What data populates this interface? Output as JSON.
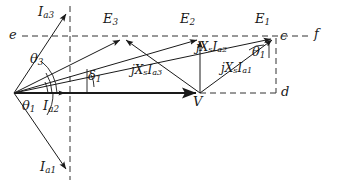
{
  "figure": {
    "type": "phasor-diagram",
    "width": 337,
    "height": 191,
    "background_color": "#ffffff",
    "line_color": "#1a1a1a",
    "dashed_color": "#333333"
  },
  "points": {
    "origin": {
      "label": "",
      "x": 14,
      "y": 93
    },
    "V": {
      "label": "V",
      "x": 200,
      "y": 93
    },
    "E1": {
      "label": "E",
      "sub": "1",
      "x": 275,
      "y": 37
    },
    "E2": {
      "label": "E",
      "sub": "2",
      "x": 200,
      "y": 37
    },
    "E3": {
      "label": "E",
      "sub": "3",
      "x": 123,
      "y": 37
    },
    "Ia1_tip": {
      "label": "I",
      "sub": "a1",
      "x": 69,
      "y": 172
    },
    "Ia2_tip": {
      "label": "I",
      "sub": "a2",
      "x": 68,
      "y": 93
    },
    "Ia3_tip": {
      "label": "I",
      "sub": "a3",
      "x": 68,
      "y": 11
    }
  },
  "axis_labels": {
    "e": "e",
    "f": "f",
    "c": "c",
    "d": "d"
  },
  "phasor_labels": {
    "E1": {
      "text": "E",
      "sub": "1"
    },
    "E2": {
      "text": "E",
      "sub": "2"
    },
    "E3": {
      "text": "E",
      "sub": "3"
    },
    "V": {
      "text": "V",
      "sub": ""
    },
    "Ia1": {
      "text": "I",
      "sub": "a1"
    },
    "Ia2": {
      "text": "I",
      "sub": "a2"
    },
    "Ia3": {
      "text": "I",
      "sub": "a3"
    }
  },
  "reactance_drops": [
    {
      "id": "jXsIa1",
      "prefix": "jX",
      "sub1": "s",
      "cur": "I",
      "sub2": "a1",
      "x": 224,
      "y": 70
    },
    {
      "id": "jXsIa2",
      "prefix": "jX",
      "sub1": "s",
      "cur": "I",
      "sub2": "a2",
      "x": 197,
      "y": 47
    },
    {
      "id": "jXsIa3",
      "prefix": "jX",
      "sub1": "s",
      "cur": "I",
      "sub2": "a3",
      "x": 133,
      "y": 71
    }
  ],
  "angles": [
    {
      "id": "theta1_origin",
      "glyph": "θ",
      "sub": "1",
      "x": 26,
      "y": 101
    },
    {
      "id": "theta3_origin",
      "glyph": "θ",
      "sub": "3",
      "x": 33,
      "y": 57
    },
    {
      "id": "delta1",
      "glyph": "δ",
      "sub": "1",
      "x": 87,
      "y": 71
    },
    {
      "id": "theta1_E1",
      "glyph": "θ",
      "sub": "1",
      "x": 254,
      "y": 49
    }
  ],
  "dashed_lines": {
    "ef_horizontal": {
      "name": "e-f reference line",
      "x1": 22,
      "y1": 36,
      "x2": 312,
      "y2": 36
    },
    "vertical_left": {
      "name": "quadrature axis",
      "x1": 70,
      "y1": 6,
      "x2": 70,
      "y2": 180
    },
    "d_horizontal": {
      "name": "V to d line",
      "x1": 200,
      "y1": 93,
      "x2": 278,
      "y2": 93
    },
    "vertical_right": {
      "name": "c-d vertical",
      "x1": 276,
      "y1": 38,
      "x2": 276,
      "y2": 93
    }
  }
}
